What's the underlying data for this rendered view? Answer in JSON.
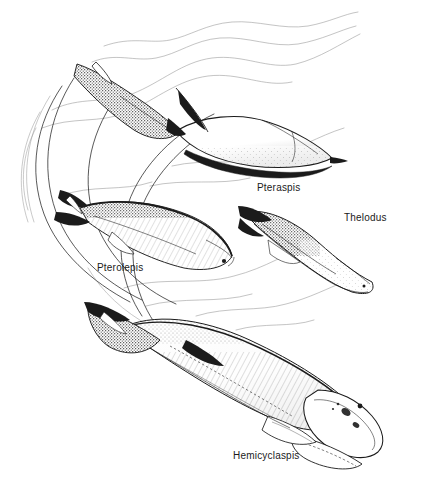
{
  "figure": {
    "kind": "scientific-illustration",
    "style": "pen-and-ink line drawing with stipple shading",
    "background_color": "#ffffff",
    "ink_color": "#1b1b1b",
    "width": 421,
    "height": 484
  },
  "labels": {
    "pteraspis": "Pteraspis",
    "thelodus": "Thelodus",
    "pterolepis": "Pterolepis",
    "hemicyclaspis": "Hemicyclaspis"
  },
  "specimens": [
    {
      "name": "Pteraspis",
      "label": "Pteraspis",
      "position": "upper-right",
      "orientation": "head lower-right, tail upper-left",
      "features": "pointed rostrum, armored head shield, stippled forked caudal fin, dorsal spine"
    },
    {
      "name": "Thelodus",
      "label": "Thelodus",
      "position": "middle-right",
      "orientation": "head lower-right, tail upper-left",
      "features": "flattened body, broad rounded head, small eye, forked tail, stippled scale cover"
    },
    {
      "name": "Pterolepis",
      "label": "Pterolepis",
      "position": "middle-left",
      "orientation": "head right, tail left",
      "features": "elongate eel-like body, visible eye, hatched flank, dark dorsal ridge, forked tail"
    },
    {
      "name": "Hemicyclaspis",
      "label": "Hemicyclaspis",
      "position": "lower-centre",
      "orientation": "head lower-right, tail upper-left",
      "features": "largest figure, broad semicircular cephalic shield, dorsal eyes, pectoral flaps, heterocercal tail"
    }
  ],
  "background_elements": {
    "water_lines": "faint wavy horizon and current lines across the upper half",
    "motion_arcs": "sweeping curved trail lines on the left side"
  }
}
